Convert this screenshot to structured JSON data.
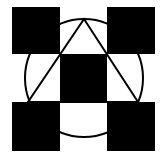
{
  "diagram": {
    "background": "#ffffff",
    "fill_color": "#000000",
    "stroke_color": "#000000",
    "squares": [
      {
        "name": "top-left",
        "x": 12,
        "y": 7,
        "w": 48,
        "h": 47
      },
      {
        "name": "top-right",
        "x": 107,
        "y": 7,
        "w": 48,
        "h": 47
      },
      {
        "name": "center",
        "x": 60,
        "y": 54,
        "w": 47,
        "h": 48
      },
      {
        "name": "bottom-left",
        "x": 12,
        "y": 102,
        "w": 48,
        "h": 49
      },
      {
        "name": "bottom-right",
        "x": 107,
        "y": 102,
        "w": 48,
        "h": 49
      }
    ],
    "circle": {
      "cx": 84,
      "cy": 78,
      "r": 59
    },
    "triangle": {
      "points": "84,19 28,102 138,102"
    }
  }
}
